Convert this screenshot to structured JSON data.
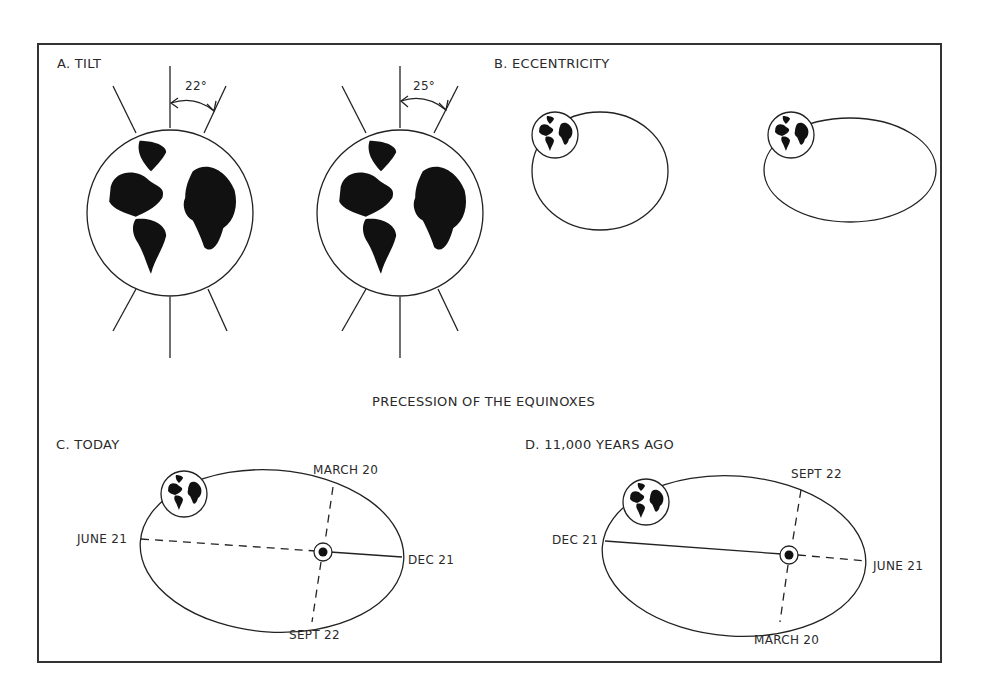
{
  "panels": {
    "tilt": {
      "label": "A.  TILT",
      "angle_left": "22°",
      "angle_right": "25°"
    },
    "eccentricity": {
      "label": "B.  ECCENTRICITY"
    },
    "precession_title": "PRECESSION OF THE EQUINOXES",
    "today": {
      "label": "C. TODAY",
      "points": {
        "top": "MARCH 20",
        "left": "JUNE 21",
        "right": "DEC 21",
        "bottom": "SEPT 22"
      }
    },
    "past": {
      "label": "D. 11,000 YEARS AGO",
      "points": {
        "top": "SEPT 22",
        "left": "DEC 21",
        "right": "JUNE 21",
        "bottom": "MARCH 20"
      }
    }
  },
  "colors": {
    "ink": "#222222",
    "background": "#ffffff"
  }
}
